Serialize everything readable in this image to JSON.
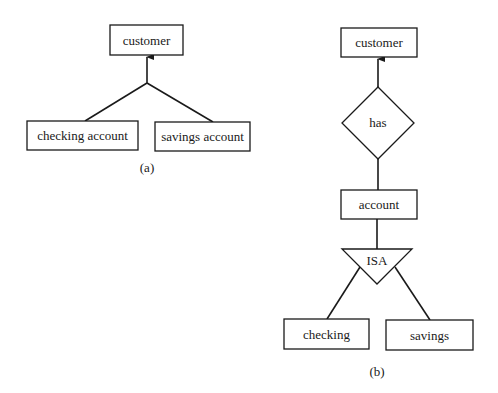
{
  "diagram_a": {
    "caption": "(a)",
    "parent": {
      "label": "customer"
    },
    "children": [
      {
        "label": "checking account"
      },
      {
        "label": "savings account"
      }
    ]
  },
  "diagram_b": {
    "caption": "(b)",
    "top_entity": {
      "label": "customer"
    },
    "relationship": {
      "label": "has"
    },
    "middle_entity": {
      "label": "account"
    },
    "isa": {
      "label": "ISA"
    },
    "children": [
      {
        "label": "checking"
      },
      {
        "label": "savings"
      }
    ]
  },
  "colors": {
    "stroke": "#1a1a1a",
    "background": "#ffffff"
  }
}
